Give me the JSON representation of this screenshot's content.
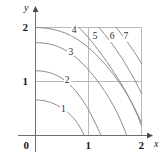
{
  "figure": {
    "type": "contour-plot",
    "background": "#ffffff",
    "curve_color": "#8c8c8c",
    "grid_color": "#b0b0b0",
    "axis_color": "#6e6e6e",
    "text_color": "#1a1a1a"
  },
  "axes": {
    "x_label": "x",
    "y_label": "y",
    "origin_label": "0",
    "x_ticks": [
      {
        "value": 1,
        "label": "1"
      },
      {
        "value": 2,
        "label": "2"
      }
    ],
    "y_ticks": [
      {
        "value": 1,
        "label": "1"
      },
      {
        "value": 2,
        "label": "2"
      }
    ],
    "xlim": [
      0,
      2.2
    ],
    "ylim": [
      0,
      2.2
    ],
    "grid": true
  },
  "chart_data": {
    "type": "line",
    "title": "",
    "xlabel": "x",
    "ylabel": "y",
    "xlim": [
      0,
      2.2
    ],
    "ylim": [
      0,
      2.2
    ],
    "grid": true,
    "legend": "none",
    "categories": [
      "1",
      "2",
      "3",
      "4",
      "5",
      "6",
      "7"
    ],
    "series": [
      {
        "name": "1",
        "level": 1,
        "label": "1",
        "label_xy": [
          0.52,
          0.47
        ],
        "points": [
          [
            0.0,
            0.66
          ],
          [
            0.08,
            0.655
          ],
          [
            0.16,
            0.645
          ],
          [
            0.24,
            0.625
          ],
          [
            0.32,
            0.6
          ],
          [
            0.4,
            0.565
          ],
          [
            0.48,
            0.52
          ],
          [
            0.56,
            0.465
          ],
          [
            0.64,
            0.4
          ],
          [
            0.72,
            0.32
          ],
          [
            0.8,
            0.22
          ],
          [
            0.86,
            0.12
          ],
          [
            0.92,
            0.0
          ]
        ]
      },
      {
        "name": "2",
        "level": 2,
        "label": "2",
        "label_xy": [
          0.59,
          1.01
        ],
        "points": [
          [
            0.0,
            1.2
          ],
          [
            0.1,
            1.195
          ],
          [
            0.2,
            1.18
          ],
          [
            0.3,
            1.155
          ],
          [
            0.4,
            1.115
          ],
          [
            0.5,
            1.06
          ],
          [
            0.6,
            0.985
          ],
          [
            0.7,
            0.89
          ],
          [
            0.8,
            0.775
          ],
          [
            0.9,
            0.64
          ],
          [
            1.0,
            0.48
          ],
          [
            1.1,
            0.29
          ],
          [
            1.18,
            0.12
          ],
          [
            1.24,
            0.0
          ]
        ]
      },
      {
        "name": "3",
        "level": 3,
        "label": "3",
        "label_xy": [
          0.66,
          1.52
        ],
        "points": [
          [
            0.0,
            1.72
          ],
          [
            0.12,
            1.715
          ],
          [
            0.24,
            1.7
          ],
          [
            0.36,
            1.67
          ],
          [
            0.48,
            1.625
          ],
          [
            0.6,
            1.56
          ],
          [
            0.72,
            1.48
          ],
          [
            0.84,
            1.38
          ],
          [
            0.96,
            1.26
          ],
          [
            1.1,
            1.1
          ],
          [
            1.24,
            0.92
          ],
          [
            1.38,
            0.71
          ],
          [
            1.5,
            0.5
          ],
          [
            1.6,
            0.3
          ],
          [
            1.68,
            0.11
          ],
          [
            1.72,
            0.0
          ]
        ]
      },
      {
        "name": "4",
        "level": 4,
        "label": "4",
        "label_xy": [
          0.72,
          1.93
        ],
        "points": [
          [
            0.0,
            2.0
          ],
          [
            0.14,
            1.995
          ],
          [
            0.28,
            1.975
          ],
          [
            0.42,
            1.945
          ],
          [
            0.56,
            1.9
          ],
          [
            0.7,
            1.835
          ],
          [
            0.84,
            1.75
          ],
          [
            0.98,
            1.645
          ],
          [
            1.12,
            1.52
          ],
          [
            1.26,
            1.38
          ],
          [
            1.4,
            1.22
          ],
          [
            1.54,
            1.04
          ],
          [
            1.68,
            0.84
          ],
          [
            1.82,
            0.6
          ],
          [
            1.94,
            0.34
          ],
          [
            2.0,
            0.18
          ]
        ]
      },
      {
        "name": "5",
        "level": 5,
        "label": "5",
        "label_xy": [
          1.12,
          1.82
        ],
        "points": [
          [
            0.82,
            2.0
          ],
          [
            0.94,
            1.88
          ],
          [
            1.06,
            1.74
          ],
          [
            1.18,
            1.59
          ],
          [
            1.3,
            1.43
          ],
          [
            1.42,
            1.26
          ],
          [
            1.54,
            1.08
          ],
          [
            1.66,
            0.89
          ],
          [
            1.78,
            0.68
          ],
          [
            1.9,
            0.45
          ],
          [
            2.0,
            0.24
          ]
        ]
      },
      {
        "name": "6",
        "level": 6,
        "label": "6",
        "label_xy": [
          1.44,
          1.82
        ],
        "points": [
          [
            1.2,
            2.0
          ],
          [
            1.31,
            1.87
          ],
          [
            1.42,
            1.73
          ],
          [
            1.53,
            1.58
          ],
          [
            1.64,
            1.42
          ],
          [
            1.75,
            1.24
          ],
          [
            1.86,
            1.05
          ],
          [
            1.95,
            0.88
          ],
          [
            2.0,
            0.78
          ]
        ]
      },
      {
        "name": "7",
        "level": 7,
        "label": "7",
        "label_xy": [
          1.7,
          1.82
        ],
        "points": [
          [
            1.52,
            2.0
          ],
          [
            1.62,
            1.88
          ],
          [
            1.72,
            1.75
          ],
          [
            1.82,
            1.61
          ],
          [
            1.92,
            1.46
          ],
          [
            2.0,
            1.33
          ]
        ]
      }
    ]
  }
}
